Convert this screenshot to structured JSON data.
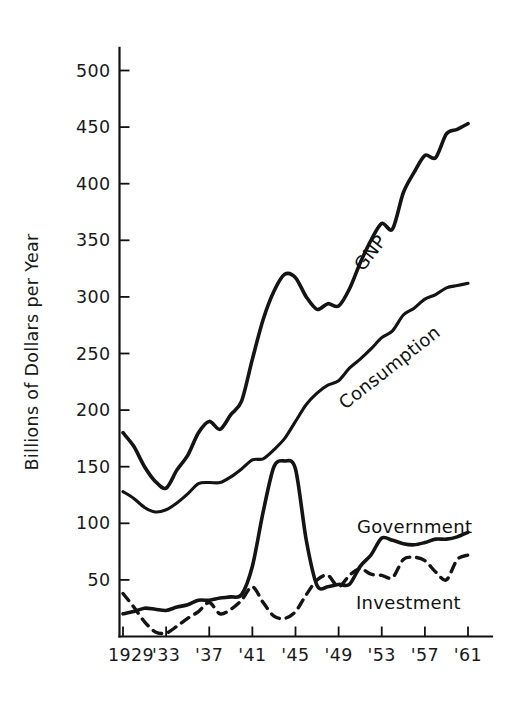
{
  "chart_data": {
    "type": "line",
    "title": "",
    "subtitle": "",
    "xlabel": "",
    "ylabel": "Billions of Dollars per Year",
    "xlim": [
      1929,
      1962
    ],
    "ylim": [
      0,
      520
    ],
    "yticks": [
      50,
      100,
      150,
      200,
      250,
      300,
      350,
      400,
      450,
      500
    ],
    "ytick_labels": [
      "50",
      "100",
      "150",
      "200",
      "250",
      "300",
      "350",
      "400",
      "450",
      "500"
    ],
    "xticks": [
      1929,
      1933,
      1937,
      1941,
      1945,
      1949,
      1953,
      1957,
      1961
    ],
    "xtick_labels": [
      "1929",
      "'33",
      "'37",
      "'41",
      "'45",
      "'49",
      "'53",
      "'57",
      "'61"
    ],
    "grid": false,
    "legend_position": "inline-curve-labels",
    "x": [
      1929,
      1930,
      1931,
      1932,
      1933,
      1934,
      1935,
      1936,
      1937,
      1938,
      1939,
      1940,
      1941,
      1942,
      1943,
      1944,
      1945,
      1946,
      1947,
      1948,
      1949,
      1950,
      1951,
      1952,
      1953,
      1954,
      1955,
      1956,
      1957,
      1958,
      1959,
      1960,
      1961
    ],
    "series": [
      {
        "name": "GNP",
        "style": "solid",
        "label_rotation": -52,
        "values": [
          180,
          168,
          150,
          137,
          131,
          147,
          160,
          180,
          190,
          183,
          196,
          208,
          245,
          280,
          305,
          320,
          317,
          300,
          289,
          294,
          292,
          307,
          330,
          350,
          365,
          360,
          392,
          410,
          425,
          423,
          444,
          448,
          453
        ]
      },
      {
        "name": "Consumption",
        "style": "solid",
        "label_rotation": -38,
        "values": [
          128,
          122,
          114,
          110,
          112,
          118,
          126,
          135,
          136,
          136,
          141,
          148,
          156,
          157,
          165,
          175,
          190,
          205,
          215,
          222,
          226,
          237,
          245,
          254,
          264,
          270,
          284,
          290,
          298,
          302,
          308,
          310,
          312
        ]
      },
      {
        "name": "Government",
        "style": "solid",
        "label_rotation": 0,
        "values": [
          20,
          22,
          25,
          24,
          23,
          26,
          28,
          32,
          32,
          34,
          35,
          37,
          62,
          110,
          150,
          155,
          148,
          85,
          45,
          44,
          46,
          46,
          62,
          72,
          87,
          85,
          82,
          81,
          83,
          86,
          86,
          88,
          92
        ]
      },
      {
        "name": "Investment",
        "style": "dashed",
        "label_rotation": 0,
        "values": [
          38,
          26,
          13,
          4,
          3,
          9,
          16,
          22,
          30,
          20,
          24,
          32,
          44,
          30,
          18,
          16,
          22,
          37,
          50,
          54,
          44,
          54,
          60,
          55,
          54,
          52,
          68,
          70,
          67,
          57,
          50,
          68,
          72
        ]
      }
    ]
  },
  "labels": {
    "y_axis_title": "Billions of Dollars per Year",
    "gnp": "GNP",
    "consumption": "Consumption",
    "government": "Government",
    "investment": "Investment"
  },
  "colors": {
    "ink": "#141414",
    "background": "#ffffff"
  }
}
